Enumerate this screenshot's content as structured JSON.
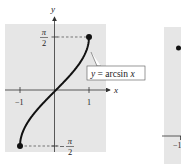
{
  "chart_data": [
    {
      "type": "line",
      "title": "",
      "function": "y = arcsin x",
      "annotation": "y = arcsin x",
      "xlabel": "x",
      "ylabel": "y",
      "xlim": [
        -1.6,
        1.6
      ],
      "ylim": [
        -1.8,
        2.2
      ],
      "x_ticks": [
        {
          "value": -1,
          "label": "−1"
        },
        {
          "value": 1,
          "label": "1"
        }
      ],
      "y_ticks": [
        {
          "value": 1.5708,
          "label_num": "π",
          "label_den": "2",
          "label": "π/2"
        },
        {
          "value": -1.5708,
          "label_num": "π",
          "label_den": "2",
          "label": "−π/2"
        }
      ],
      "endpoints": [
        {
          "x": -1,
          "y": -1.5708
        },
        {
          "x": 1,
          "y": 1.5708
        }
      ],
      "dashed_guides": true,
      "grid": false,
      "background": "#e6e6e6",
      "curve_color": "#111111"
    },
    {
      "type": "line",
      "partial": true,
      "background": "#e6e6e6",
      "x_ticks": [
        {
          "value": -1,
          "label": "−1"
        }
      ],
      "endpoints": [
        {
          "x": -1,
          "y": null
        }
      ]
    }
  ]
}
